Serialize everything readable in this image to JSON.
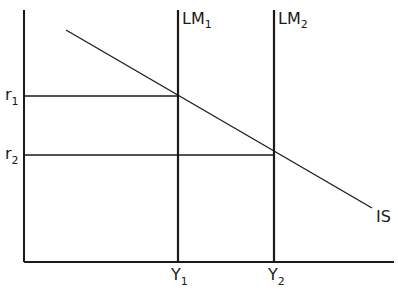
{
  "diagram": {
    "type": "IS-LM",
    "axes": {
      "y_axis_label": "",
      "x_axis_label": ""
    },
    "curves": [
      {
        "id": "LM1",
        "label": "LM",
        "subscript": "1",
        "kind": "vertical"
      },
      {
        "id": "LM2",
        "label": "LM",
        "subscript": "2",
        "kind": "vertical"
      },
      {
        "id": "IS",
        "label": "IS",
        "kind": "downward-sloping"
      }
    ],
    "y_ticks": [
      {
        "label": "r",
        "subscript": "1"
      },
      {
        "label": "r",
        "subscript": "2"
      }
    ],
    "x_ticks": [
      {
        "label": "Y",
        "subscript": "1"
      },
      {
        "label": "Y",
        "subscript": "2"
      }
    ],
    "equilibria": [
      {
        "curves": [
          "IS",
          "LM1"
        ],
        "interest": "r1",
        "output": "Y1"
      },
      {
        "curves": [
          "IS",
          "LM2"
        ],
        "interest": "r2",
        "output": "Y2"
      }
    ],
    "colors": {
      "line": "#1a1a1a",
      "background": "#ffffff"
    }
  }
}
